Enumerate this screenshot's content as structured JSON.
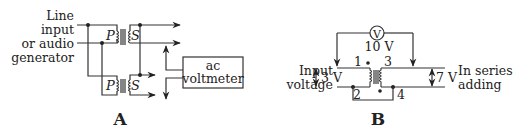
{
  "diagram_a": {
    "caption": "A",
    "input_label": [
      "Line",
      "input",
      "or audio",
      "generator"
    ],
    "primary_label": "P",
    "secondary_label": "S",
    "meter_label": [
      "ac",
      "voltmeter"
    ]
  },
  "diagram_b": {
    "caption": "B",
    "meter_symbol": "V",
    "meter_reading": "10 V",
    "input_label": [
      "Input",
      "voltage"
    ],
    "input_voltage": "3 V",
    "output_voltage": "7 V",
    "output_label": [
      "In series",
      "adding"
    ],
    "terminals": [
      "1",
      "2",
      "3",
      "4"
    ]
  }
}
